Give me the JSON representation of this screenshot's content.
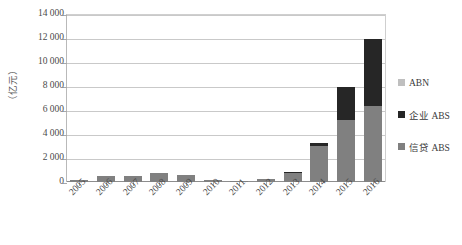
{
  "chart_data": {
    "type": "bar",
    "stacked": true,
    "title": "",
    "xlabel": "",
    "ylabel": "（亿元）",
    "ylim": [
      0,
      14000
    ],
    "ytick_step": 2000,
    "grid": true,
    "legend_position": "right",
    "categories": [
      "2005",
      "2006",
      "2007",
      "2008",
      "2009",
      "2010",
      "2011",
      "2012",
      "2013",
      "2014",
      "2015",
      "2016"
    ],
    "ytick_labels": [
      "14 000",
      "12 000",
      "10 000",
      "8 000",
      "6 000",
      "4 000",
      "2 000",
      "0"
    ],
    "ytick_values": [
      14000,
      12000,
      10000,
      8000,
      6000,
      4000,
      2000,
      0
    ],
    "series": [
      {
        "name": "信贷 ABS",
        "color": "#808080",
        "values": [
          170,
          480,
          520,
          720,
          620,
          150,
          50,
          290,
          780,
          3000,
          5200,
          6300
        ]
      },
      {
        "name": "企业 ABS",
        "color": "#262626",
        "values": [
          0,
          0,
          0,
          0,
          0,
          0,
          0,
          0,
          30,
          280,
          2700,
          5600
        ]
      },
      {
        "name": "ABN",
        "color": "#bfbfbf",
        "values": [
          0,
          0,
          0,
          0,
          0,
          0,
          0,
          0,
          0,
          0,
          0,
          0
        ]
      }
    ],
    "totals": [
      170,
      480,
      520,
      720,
      620,
      150,
      50,
      290,
      810,
      3280,
      7900,
      11900
    ]
  },
  "legend": {
    "items": [
      {
        "label": "ABN",
        "color": "#bfbfbf"
      },
      {
        "label": "企业 ABS",
        "color": "#262626"
      },
      {
        "label": "信贷 ABS",
        "color": "#808080"
      }
    ]
  }
}
